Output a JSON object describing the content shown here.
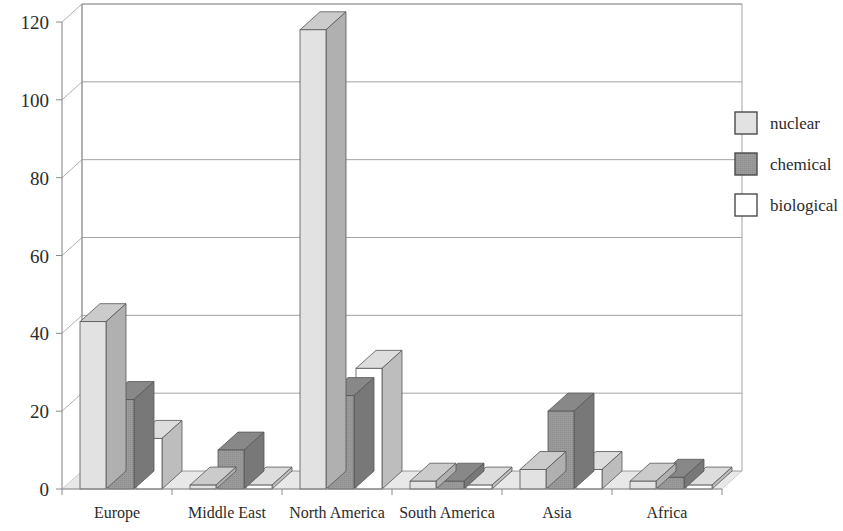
{
  "chart_data": {
    "type": "bar",
    "title": "",
    "subtitle": "",
    "xlabel": "",
    "ylabel": "",
    "categories": [
      "Europe",
      "Middle East",
      "North America",
      "South America",
      "Asia",
      "Africa"
    ],
    "series": [
      {
        "name": "nuclear",
        "color": "#e2e2e2",
        "values": [
          43,
          1,
          118,
          2,
          5,
          2
        ]
      },
      {
        "name": "chemical",
        "color": "#9a9a9a",
        "values": [
          23,
          10,
          24,
          2,
          20,
          3
        ]
      },
      {
        "name": "biological",
        "color": "#ffffff",
        "values": [
          13,
          1,
          31,
          1,
          5,
          1
        ]
      }
    ],
    "ylim": [
      0,
      120
    ],
    "yticks": [
      0,
      20,
      40,
      60,
      80,
      100,
      120
    ],
    "ytick_labels": [
      "0",
      "20",
      "40",
      "60",
      "80",
      "100",
      "120"
    ],
    "grid": true,
    "grid_axis": "y",
    "legend_position": "right",
    "style": "3d-column",
    "background": "#ffffff",
    "axis_color": "#8a8a8a",
    "grid_color": "#9a9a9a",
    "floor_color": "#e8e8e8"
  },
  "legend": {
    "entries": [
      {
        "label": "nuclear",
        "swatch_color": "#e2e2e2"
      },
      {
        "label": "chemical",
        "swatch_color": "#9a9a9a"
      },
      {
        "label": "biological",
        "swatch_color": "#ffffff"
      }
    ]
  }
}
